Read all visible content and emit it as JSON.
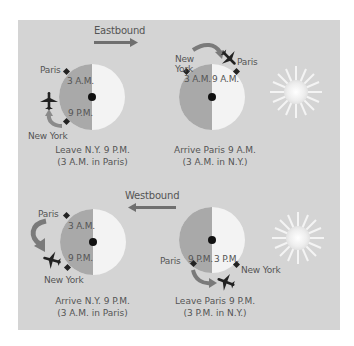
{
  "colors": {
    "panel": "#d4d4d4",
    "night": "#a9a9a9",
    "day": "#f3f3f3",
    "marker": "#222222",
    "arrow": "#7a7a7a",
    "text": "#555555"
  },
  "eastbound": {
    "direction_label": "Eastbound",
    "departure": {
      "city_top": "Paris",
      "city_bottom": "New York",
      "time_top": "3 A.M.",
      "time_bottom": "9 P.M.",
      "caption_line1": "Leave N.Y. 9 P.M.",
      "caption_line2": "(3 A.M. in Paris)"
    },
    "arrival": {
      "city_left": "New York",
      "city_right": "Paris",
      "time_left": "3 A.M.",
      "time_right": "9 A.M.",
      "caption_line1": "Arrive Paris 9 A.M.",
      "caption_line2": "(3 A.M. in N.Y.)"
    }
  },
  "westbound": {
    "direction_label": "Westbound",
    "arrival": {
      "city_top": "Paris",
      "city_bottom": "New York",
      "time_top": "3 A.M.",
      "time_bottom": "9 P.M.",
      "caption_line1": "Arrive N.Y. 9 P.M.",
      "caption_line2": "(3 A.M. in Paris)"
    },
    "departure": {
      "city_left": "Paris",
      "city_right": "New York",
      "time_left": "9 P.M.",
      "time_right": "3 P.M.",
      "caption_line1": "Leave Paris 9 P.M.",
      "caption_line2": "(3 P.M. in N.Y.)"
    }
  }
}
